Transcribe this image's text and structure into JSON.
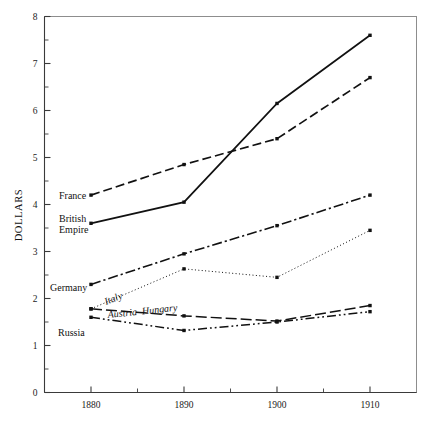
{
  "chart_data": {
    "type": "line",
    "title": "",
    "xlabel": "",
    "ylabel": "DOLLARS",
    "x": [
      1880,
      1890,
      1900,
      1910
    ],
    "xtick_labels": [
      "1880",
      "1890",
      "1900",
      "1910"
    ],
    "ytick_labels": [
      "0",
      "1",
      "2",
      "3",
      "4",
      "5",
      "6",
      "7",
      "8"
    ],
    "ytick_values": [
      0,
      1,
      2,
      3,
      4,
      5,
      6,
      7,
      8
    ],
    "xlim": [
      1875,
      1915
    ],
    "ylim": [
      0,
      8
    ],
    "grid": false,
    "legend": "inline-labels",
    "series": [
      {
        "name": "British Empire",
        "label": "British\nEmpire",
        "label_line1": "British",
        "label_line2": "Empire",
        "style": "solid",
        "values": [
          3.6,
          4.05,
          6.15,
          7.6
        ]
      },
      {
        "name": "France",
        "label": "France",
        "style": "dashed",
        "values": [
          4.2,
          4.85,
          5.4,
          6.7
        ]
      },
      {
        "name": "Germany",
        "label": "Germany",
        "style": "dash-dot",
        "values": [
          2.3,
          2.95,
          3.55,
          4.2
        ]
      },
      {
        "name": "Italy",
        "label": "Italy",
        "style": "dotted",
        "values": [
          1.78,
          2.63,
          2.45,
          3.45
        ]
      },
      {
        "name": "Austria-Hungary",
        "label": "Austria–Hungary",
        "style": "long-dash",
        "values": [
          1.78,
          1.63,
          1.52,
          1.85
        ]
      },
      {
        "name": "Russia",
        "label": "Russia",
        "style": "dash-dot-dot",
        "values": [
          1.6,
          1.32,
          1.5,
          1.72
        ]
      }
    ]
  },
  "axes": {
    "y_axis_title": "DOLLARS"
  },
  "labels": {
    "france": "France",
    "british": "British",
    "empire": "Empire",
    "germany": "Germany",
    "italy": "Italy",
    "austria_hungary": "Austria–Hungary",
    "russia": "Russia"
  },
  "xticks": [
    "1880",
    "1890",
    "1900",
    "1910"
  ],
  "yticks": [
    "0",
    "1",
    "2",
    "3",
    "4",
    "5",
    "6",
    "7",
    "8"
  ],
  "colors": {
    "line": "#111111",
    "axis": "#3a3a3a",
    "frame": "#8d8d8d",
    "background": "#ffffff"
  }
}
